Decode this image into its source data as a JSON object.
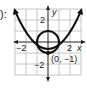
{
  "fragment_text": "):",
  "graph": {
    "x_axis_label": "x",
    "y_axis_label": "y",
    "x_ticks": [
      "−2",
      "2"
    ],
    "y_ticks": [
      "2",
      "−2"
    ],
    "point_label": "(0, −1)",
    "curves": [
      {
        "name": "parabola",
        "equation": "y = x^2 - 1",
        "vertex": [
          0,
          -1
        ]
      },
      {
        "name": "circle",
        "equation": "x^2 + y^2 = 1",
        "center": [
          0,
          0
        ],
        "radius": 1
      }
    ],
    "grid": {
      "xmin": -3,
      "xmax": 3,
      "ymin": -3,
      "ymax": 3,
      "step": 1
    },
    "colors": {
      "grid": "#b8b8b8",
      "axis": "#222222",
      "curve": "#111111"
    }
  }
}
